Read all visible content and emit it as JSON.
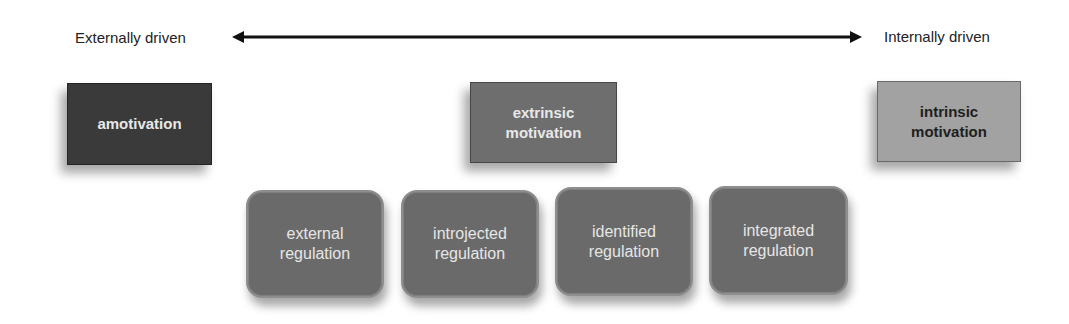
{
  "diagram": {
    "axis": {
      "left_label": "Externally driven",
      "right_label": "Internally driven",
      "arrow": "double-headed"
    },
    "top_boxes": [
      {
        "id": "amotivation",
        "line1": "amotivation",
        "line2": "",
        "fill": "#3a3a3a",
        "text_color": "#e8e8e8"
      },
      {
        "id": "extrinsic",
        "line1": "extrinsic",
        "line2": "motivation",
        "fill": "#6e6e6e",
        "text_color": "#e8e8e8"
      },
      {
        "id": "intrinsic",
        "line1": "intrinsic",
        "line2": "motivation",
        "fill": "#a2a2a2",
        "text_color": "#1e1e1e"
      }
    ],
    "regulation_boxes": [
      {
        "line1": "external",
        "line2": "regulation"
      },
      {
        "line1": "introjected",
        "line2": "regulation"
      },
      {
        "line1": "identified",
        "line2": "regulation"
      },
      {
        "line1": "integrated",
        "line2": "regulation"
      }
    ],
    "colors": {
      "regulation_fill": "#6a6a6a",
      "regulation_text": "#e6e6e6",
      "arrow": "#111111"
    }
  }
}
